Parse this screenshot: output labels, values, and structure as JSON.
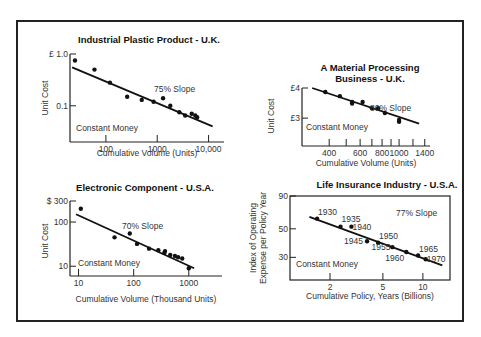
{
  "chart_data": [
    {
      "id": "plastic",
      "type": "scatter",
      "title": "Industrial Plastic Product - U.K.",
      "xlabel": "Cumulative Volume (Units)",
      "ylabel": "Unit Cost",
      "xscale": "log",
      "yscale": "log",
      "xlim": [
        20,
        20000
      ],
      "ylim": [
        0.02,
        1.0
      ],
      "xticks": [
        100,
        1000,
        10000
      ],
      "xtick_labels": [
        "100",
        "1000",
        "10,000"
      ],
      "yticks": [
        1.0,
        0.1
      ],
      "ytick_labels": [
        "£ 1.0",
        "0.1"
      ],
      "annotations": [
        "75% Slope",
        "Constant Money"
      ],
      "points": [
        [
          25,
          0.75
        ],
        [
          60,
          0.5
        ],
        [
          120,
          0.28
        ],
        [
          260,
          0.15
        ],
        [
          500,
          0.13
        ],
        [
          850,
          0.12
        ],
        [
          1300,
          0.14
        ],
        [
          1800,
          0.1
        ],
        [
          2700,
          0.075
        ],
        [
          3500,
          0.065
        ],
        [
          4700,
          0.07
        ],
        [
          5500,
          0.065
        ],
        [
          6000,
          0.06
        ]
      ],
      "trend": [
        [
          22,
          0.55
        ],
        [
          12000,
          0.04
        ]
      ],
      "grid": false
    },
    {
      "id": "material",
      "type": "scatter",
      "title": "A Material Processing Business - U.K.",
      "title_lines": [
        "A  Material Processing",
        "Business - U.K."
      ],
      "xlabel": "Cumulative Volume (Units)",
      "ylabel": "Unit Cost",
      "xscale": "log",
      "yscale": "log",
      "xlim": [
        280,
        1500
      ],
      "ylim": [
        2.3,
        4.0
      ],
      "xticks": [
        400,
        600,
        800,
        1000,
        1400
      ],
      "xtick_labels": [
        "400",
        "600",
        "800",
        "1000",
        "1400"
      ],
      "extra_xticks": [
        500,
        700,
        900,
        1200
      ],
      "yticks": [
        4,
        3
      ],
      "ytick_labels": [
        "£4",
        "£3"
      ],
      "annotations": [
        "80% Slope",
        "Constant Money"
      ],
      "points": [
        [
          380,
          3.85
        ],
        [
          460,
          3.7
        ],
        [
          540,
          3.5
        ],
        [
          540,
          3.45
        ],
        [
          620,
          3.5
        ],
        [
          700,
          3.3
        ],
        [
          760,
          3.3
        ],
        [
          830,
          3.15
        ],
        [
          1000,
          2.9
        ],
        [
          1000,
          2.95
        ]
      ],
      "trend": [
        [
          320,
          4.0
        ],
        [
          1300,
          2.85
        ]
      ],
      "grid": false
    },
    {
      "id": "electronic",
      "type": "scatter",
      "title": "Electronic Component - U.S.A.",
      "xlabel": "Cumulative Volume (Thousand Units)",
      "ylabel": "Unit Cost",
      "xscale": "log",
      "yscale": "log",
      "xlim": [
        7,
        4000
      ],
      "ylim": [
        6,
        300
      ],
      "xticks": [
        10,
        100,
        1000
      ],
      "xtick_labels": [
        "10",
        "100",
        "1000"
      ],
      "yticks": [
        300,
        100,
        10
      ],
      "ytick_labels": [
        "$ 300",
        "100",
        "10"
      ],
      "annotations": [
        "70% Slope",
        "Constant Money"
      ],
      "points": [
        [
          11,
          200
        ],
        [
          45,
          45
        ],
        [
          85,
          55
        ],
        [
          115,
          32
        ],
        [
          190,
          25
        ],
        [
          280,
          23
        ],
        [
          360,
          20
        ],
        [
          370,
          22
        ],
        [
          460,
          18
        ],
        [
          560,
          17
        ],
        [
          640,
          16
        ],
        [
          760,
          15
        ],
        [
          1000,
          9
        ]
      ],
      "trend": [
        [
          9,
          150
        ],
        [
          1250,
          9
        ]
      ],
      "grid": false
    },
    {
      "id": "insurance",
      "type": "scatter",
      "title": "Life Insurance Industry - U.S.A.",
      "xlabel": "Cumulative Policy,  Years (Billions)",
      "ylabel": "Index of Operating Expense per Policy Year",
      "ylabel_lines": [
        "Index of Operating",
        "Expense per Policy Year"
      ],
      "xscale": "log",
      "yscale": "log",
      "xlim": [
        1.0,
        16
      ],
      "ylim": [
        20,
        90
      ],
      "xticks": [
        2,
        5,
        10
      ],
      "xtick_labels": [
        "2",
        "5",
        "10"
      ],
      "yticks": [
        90,
        50,
        30
      ],
      "ytick_labels": [
        "90",
        "50",
        "30"
      ],
      "annotations": [
        "77% Slope",
        "Constant Money"
      ],
      "points": [
        {
          "x": 1.6,
          "y": 60,
          "label": "1930"
        },
        {
          "x": 2.4,
          "y": 52,
          "label": "1935"
        },
        {
          "x": 2.9,
          "y": 52,
          "label": "1940"
        },
        {
          "x": 3.8,
          "y": 40,
          "label": "1945"
        },
        {
          "x": 4.6,
          "y": 39,
          "label": "1950"
        },
        {
          "x": 5.9,
          "y": 36,
          "label": "1955"
        },
        {
          "x": 7.5,
          "y": 33,
          "label": "1960"
        },
        {
          "x": 9.2,
          "y": 31,
          "label": "1965"
        },
        {
          "x": 10.5,
          "y": 29,
          "label": "1970"
        }
      ],
      "trend": [
        [
          1.4,
          62
        ],
        [
          14,
          26
        ]
      ],
      "boxed": true,
      "grid": false
    }
  ]
}
